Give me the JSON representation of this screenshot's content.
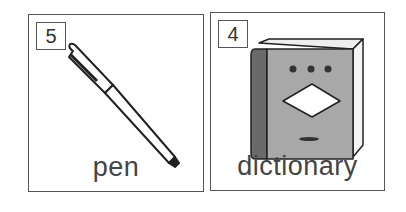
{
  "cards": [
    {
      "number": "5",
      "word": "pen",
      "icon": "pen-icon"
    },
    {
      "number": "4",
      "word": "dictionary",
      "icon": "book-icon"
    }
  ],
  "colors": {
    "border": "#555555",
    "book_cover": "#a8a8a8",
    "book_spine": "#6a6a6a"
  }
}
